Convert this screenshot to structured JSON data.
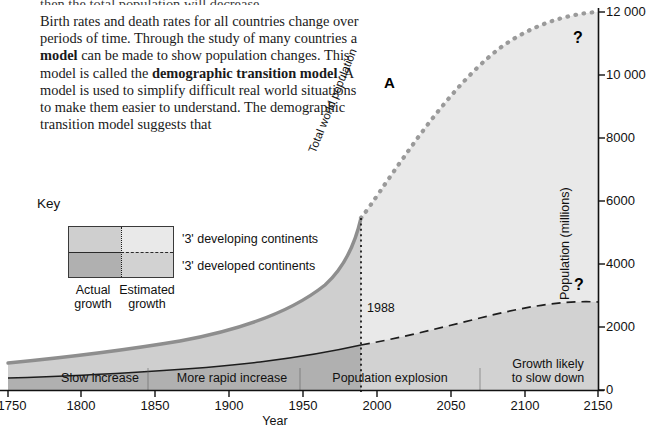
{
  "prose": {
    "cut_line": "then the total population will decrease.",
    "paragraph_parts": [
      {
        "text": "Birth rates and death rates for all countries change over periods of time. Through the study of many countries a ",
        "bold": false
      },
      {
        "text": "model",
        "bold": true
      },
      {
        "text": " can be made to show population changes. This model is called the ",
        "bold": false
      },
      {
        "text": "demographic transition model",
        "bold": true
      },
      {
        "text": ". A model is used to simplify difficult real world situations to make them easier to understand. The demographic transition model suggests that",
        "bold": false
      }
    ]
  },
  "figure": {
    "marker_label": "A",
    "curve_label": "Total world population",
    "event_year_label": "1988",
    "question_mark": "?",
    "uncertainty_markers": [
      "?",
      "?"
    ]
  },
  "key": {
    "title": "Key",
    "legend_rows": [
      {
        "label": "'3' developing continents"
      },
      {
        "label": "'3' developed continents"
      }
    ],
    "column_labels": [
      {
        "line1": "Actual",
        "line2": "growth"
      },
      {
        "line1": "Estimated",
        "line2": "growth"
      }
    ],
    "colors": {
      "developing_actual": "#cfcfcf",
      "developing_estimated": "#e9e9e9",
      "developed_actual": "#b0b0b0",
      "developed_estimated": "#d2d2d2"
    }
  },
  "chart_data": {
    "type": "area",
    "title": "",
    "xlabel": "Year",
    "ylabel": "Population (millions)",
    "xlim": [
      1750,
      2150
    ],
    "ylim": [
      0,
      12000
    ],
    "xticks": [
      1750,
      1800,
      1850,
      1900,
      1950,
      2000,
      2050,
      2100,
      2150
    ],
    "yticks": [
      0,
      2000,
      4000,
      6000,
      8000,
      10000,
      12000
    ],
    "ytick_labels": [
      "0",
      "2000",
      "4000",
      "6000",
      "8000",
      "10 000",
      "12 000"
    ],
    "grid": false,
    "legend_position": "upper-left-external",
    "actual_estimated_split_year": 1988,
    "x": [
      1750,
      1800,
      1850,
      1900,
      1950,
      1988,
      2000,
      2050,
      2100,
      2150
    ],
    "series": [
      {
        "name": "Total world population",
        "role": "total",
        "style": "solid-actual-then-dotted-estimated",
        "color": "#8c8c8c",
        "values": [
          790,
          980,
          1260,
          1650,
          2520,
          5100,
          6100,
          9200,
          11000,
          11600
        ]
      },
      {
        "name": "'3' developed continents",
        "role": "developed-lower-band",
        "style": "solid-actual-then-dashed-estimated",
        "color": "#2a2a2a",
        "values": [
          200,
          280,
          400,
          620,
          830,
          1200,
          1280,
          1600,
          1800,
          2950
        ]
      }
    ],
    "bands": [
      {
        "name": "'3' developed continents",
        "fill_actual": "#b0b0b0",
        "fill_estimated": "#d2d2d2",
        "from": "zero",
        "to": "developed"
      },
      {
        "name": "'3' developing continents",
        "fill_actual": "#cfcfcf",
        "fill_estimated": "#e9e9e9",
        "from": "developed",
        "to": "total"
      }
    ],
    "phase_bands": [
      {
        "label": "Slow increase",
        "start": 1750,
        "end": 1860
      },
      {
        "label": "More rapid increase",
        "start": 1860,
        "end": 1960
      },
      {
        "label": "Population explosion",
        "start": 1960,
        "end": 2060
      },
      {
        "label": "Growth likely to slow down",
        "start": 2060,
        "end": 2150
      }
    ],
    "annotations": [
      {
        "text": "A",
        "x": 2005,
        "y": 10300,
        "type": "figure-marker"
      },
      {
        "text": "1988",
        "x": 1995,
        "y": 2900,
        "type": "year-callout"
      },
      {
        "text": "?",
        "x": 2135,
        "y": 11400,
        "type": "uncertainty"
      },
      {
        "text": "?",
        "x": 2140,
        "y": 3250,
        "type": "uncertainty"
      }
    ]
  }
}
